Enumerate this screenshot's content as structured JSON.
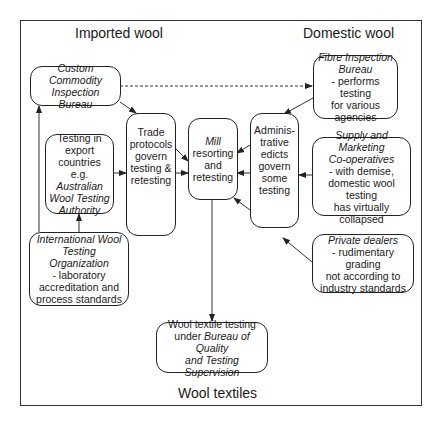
{
  "regions": {
    "imported": "Imported wool",
    "domestic": "Domestic wool",
    "textiles": "Wool textiles"
  },
  "nodes": {
    "custom_commodity": {
      "title": "Custom Commodity Inspection Bureau",
      "lines": []
    },
    "fibre_inspection": {
      "title_1": "Fibre Inspection",
      "title_2": "Bureau",
      "lines": [
        "- performs testing",
        "for various",
        "agencies"
      ]
    },
    "testing_export": {
      "lines": [
        "Testing in",
        "export",
        "countries e.g."
      ],
      "italic_lines": [
        "Australian",
        "Wool Testing",
        "Authority"
      ]
    },
    "trade_protocols": {
      "lines": [
        "Trade",
        "protocols",
        "govern",
        "testing &",
        "retesting"
      ]
    },
    "mill": {
      "italic": "Mill",
      "lines": [
        "resorting",
        "and",
        "retesting"
      ]
    },
    "administrative": {
      "lines": [
        "Adminis-",
        "trative",
        "edicts",
        "govern",
        "some",
        "testing"
      ]
    },
    "supply_marketing": {
      "title_1": "Supply and Marketing",
      "title_2": "Co-operatives",
      "lines": [
        "- with demise,",
        "domestic wool testing",
        "has virtually",
        "collapsed"
      ]
    },
    "international": {
      "title_1": "International Wool",
      "title_2": "Testing",
      "title_3": "Organization",
      "lines": [
        "- laboratory",
        "accreditation and",
        "process standards"
      ]
    },
    "private_dealers": {
      "title": "Private dealers",
      "lines": [
        "- rudimentary grading",
        "not according to",
        "industry standards"
      ]
    },
    "wool_textile": {
      "line_1": "Wool textile testing",
      "line_2_plain": "under ",
      "line_2_italic": "Bureau of Quality",
      "line_3": "and Testing",
      "line_4": "Supervision"
    }
  },
  "edges": [
    {
      "from": "custom_commodity",
      "to": "fibre_inspection",
      "style": "dashed"
    },
    {
      "from": "custom_commodity",
      "to": "trade_protocols",
      "style": "solid"
    },
    {
      "from": "international",
      "to": "custom_commodity",
      "style": "solid"
    },
    {
      "from": "international",
      "to": "testing_export",
      "style": "solid"
    },
    {
      "from": "testing_export",
      "to": "trade_protocols",
      "style": "solid"
    },
    {
      "from": "trade_protocols",
      "to": "mill",
      "style": "solid"
    },
    {
      "from": "fibre_inspection",
      "to": "administrative",
      "style": "solid"
    },
    {
      "from": "supply_marketing",
      "to": "administrative",
      "style": "solid"
    },
    {
      "from": "private_dealers",
      "to": "administrative",
      "style": "solid"
    },
    {
      "from": "administrative",
      "to": "mill",
      "style": "solid"
    },
    {
      "from": "mill",
      "to": "wool_textile",
      "style": "solid"
    }
  ]
}
